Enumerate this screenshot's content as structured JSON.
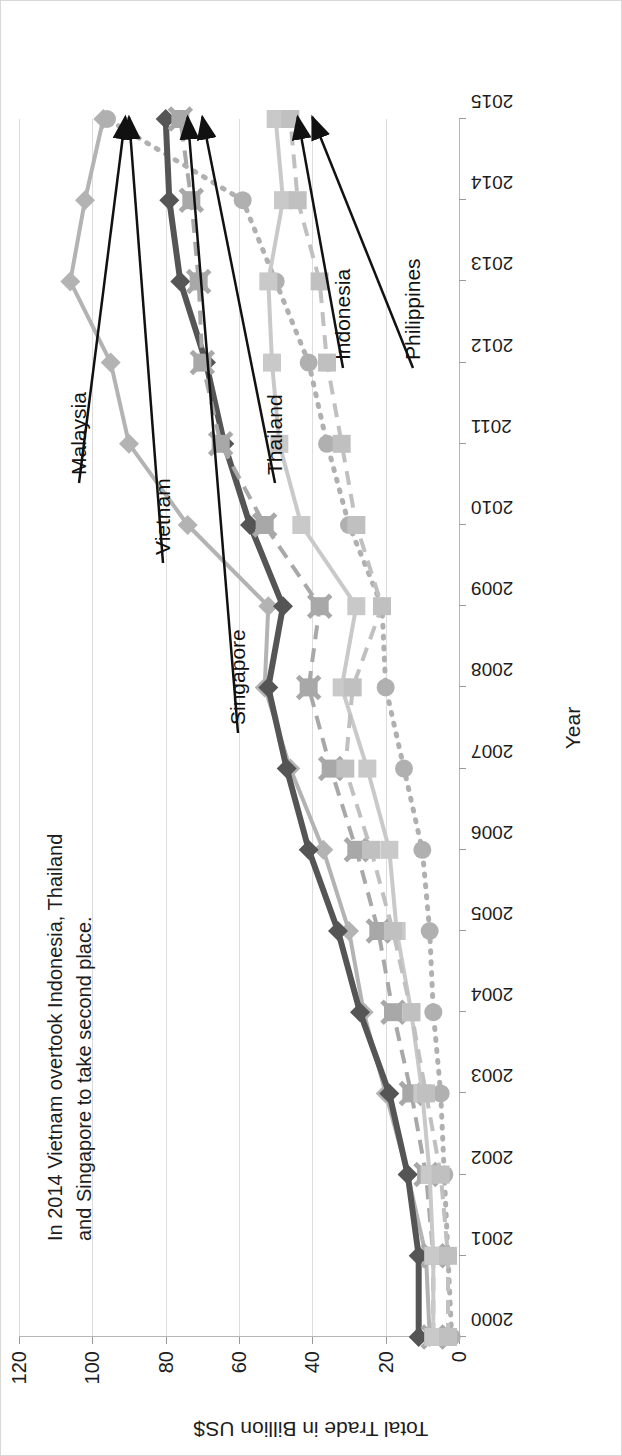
{
  "chart_data": {
    "type": "line",
    "title": "",
    "xlabel": "Year",
    "ylabel": "Total Trade in Billion US$",
    "ylim": [
      0,
      120
    ],
    "yticks": [
      0,
      20,
      40,
      60,
      80,
      100,
      120
    ],
    "grid": true,
    "legend_position": "inline-labels-with-arrows",
    "annotation": "In 2014 Vietnam overtook Indonesia, Thailand and Singapore to take second place.",
    "categories": [
      "2000",
      "2001",
      "2002",
      "2003",
      "2004",
      "2005",
      "2006",
      "2007",
      "2008",
      "2009",
      "2010",
      "2011",
      "2012",
      "2013",
      "2014",
      "2015"
    ],
    "series": [
      {
        "name": "Malaysia",
        "marker": "diamond",
        "color": "#b3b3b3",
        "linestyle": "solid",
        "values": [
          8,
          9,
          14,
          20,
          26,
          30,
          37,
          46,
          53,
          52,
          74,
          90,
          95,
          106,
          102,
          97
        ]
      },
      {
        "name": "Vietnam",
        "marker": "circle",
        "color": "#b0b0b0",
        "linestyle": "dotted",
        "values": [
          2,
          3,
          4,
          5,
          7,
          8,
          10,
          15,
          20,
          21,
          30,
          36,
          41,
          50,
          59,
          96
        ]
      },
      {
        "name": "Singapore",
        "marker": "diamond",
        "color": "#555555",
        "linestyle": "solid",
        "values": [
          11,
          11,
          14,
          19,
          27,
          33,
          41,
          47,
          52,
          48,
          57,
          64,
          69,
          76,
          79,
          80
        ]
      },
      {
        "name": "Thailand",
        "marker": "x-square",
        "color": "#a8a8a8",
        "linestyle": "dashed",
        "values": [
          7,
          7,
          9,
          13,
          18,
          22,
          28,
          35,
          41,
          38,
          53,
          65,
          70,
          71,
          73,
          76
        ]
      },
      {
        "name": "Indonesia",
        "marker": "square",
        "color": "#c9c9c9",
        "linestyle": "solid",
        "values": [
          7,
          7,
          8,
          10,
          13,
          17,
          19,
          25,
          32,
          28,
          43,
          49,
          51,
          52,
          48,
          50
        ]
      },
      {
        "name": "Philippines",
        "marker": "square",
        "color": "#c0c0c0",
        "linestyle": "dashed",
        "values": [
          3,
          3,
          5,
          9,
          13,
          18,
          24,
          31,
          29,
          21,
          28,
          32,
          36,
          38,
          44,
          46
        ]
      }
    ]
  }
}
